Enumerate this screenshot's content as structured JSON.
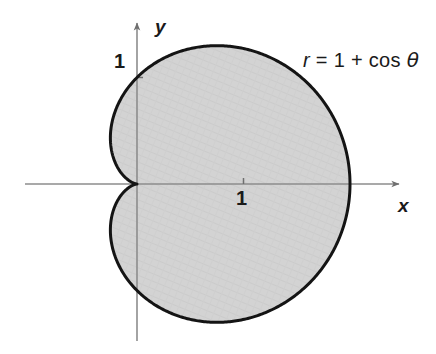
{
  "figure": {
    "kind": "polar-curve-plot",
    "background_color": "#ffffff",
    "curve_color": "#141414",
    "fill_color": "#d2d2d2",
    "axis_color": "#8d8d8d",
    "text_color": "#1a1a1a"
  },
  "axes": {
    "x_label": "x",
    "y_label": "y",
    "x_ticks": [
      {
        "value": 1,
        "label": "1"
      }
    ],
    "y_ticks": [
      {
        "value": 1,
        "label": "1"
      }
    ],
    "origin_px": {
      "x": 137,
      "y": 184
    },
    "unit_px": 106.5,
    "x_axis_span_px": {
      "from": 25,
      "to": 404
    },
    "y_axis_span_px": {
      "from": 18,
      "to": 341
    },
    "grid": false
  },
  "annotation": {
    "equation_r": "r",
    "equation_eq": "=",
    "equation_rhs_one": "1",
    "equation_plus": "+",
    "equation_cos": "cos",
    "equation_theta": "θ",
    "equation_full": "r = 1 + cos θ"
  },
  "chart_data": {
    "type": "line",
    "title": "",
    "subtitle": "",
    "xlabel": "x",
    "ylabel": "y",
    "curve_name": "cardioid",
    "polar_equation": "r = 1 + cos(theta)",
    "coordinate_system": "polar",
    "shaded_region": "interior of cardioid",
    "theta_range_deg": [
      0,
      360
    ],
    "xlim": [
      -1.29,
      3.55
    ],
    "ylim": [
      -1.55,
      1.55
    ],
    "xticks": [
      1
    ],
    "xticklabels": [
      "1"
    ],
    "yticks": [
      1
    ],
    "yticklabels": [
      "1"
    ],
    "grid": false,
    "legend": null,
    "annotations": [
      {
        "text": "r = 1 + cos θ",
        "x": 1.65,
        "y": 1.18
      }
    ],
    "key_points": [
      {
        "label": "cusp (theta=180deg)",
        "r": 0,
        "theta_deg": 180,
        "x": 0,
        "y": 0
      },
      {
        "label": "right vertex (theta=0deg)",
        "r": 2,
        "theta_deg": 0,
        "x": 2,
        "y": 0
      },
      {
        "label": "top (theta=90deg)",
        "r": 1,
        "theta_deg": 90,
        "x": 0,
        "y": 1
      },
      {
        "label": "bottom (theta=270deg)",
        "r": 1,
        "theta_deg": 270,
        "x": 0,
        "y": -1
      },
      {
        "label": "max y (theta=60deg)",
        "r": 1.5,
        "theta_deg": 60,
        "x": 0.75,
        "y": 1.299
      },
      {
        "label": "min y (theta=300deg)",
        "r": 1.5,
        "theta_deg": 300,
        "x": 0.75,
        "y": -1.299
      },
      {
        "label": "leftmost (theta=120deg)",
        "r": 0.5,
        "theta_deg": 120,
        "x": -0.25,
        "y": 0.433
      }
    ],
    "series": [
      {
        "name": "r = 1 + cos(theta)",
        "theta_deg": [
          0,
          15,
          30,
          45,
          60,
          75,
          90,
          105,
          120,
          135,
          150,
          165,
          180,
          195,
          210,
          225,
          240,
          255,
          270,
          285,
          300,
          315,
          330,
          345,
          360
        ],
        "r": [
          2.0,
          1.966,
          1.866,
          1.707,
          1.5,
          1.259,
          1.0,
          0.741,
          0.5,
          0.293,
          0.134,
          0.034,
          0.0,
          0.034,
          0.134,
          0.293,
          0.5,
          0.741,
          1.0,
          1.259,
          1.5,
          1.707,
          1.866,
          1.966,
          2.0
        ],
        "x": [
          2.0,
          1.899,
          1.616,
          1.207,
          0.75,
          0.326,
          0.0,
          -0.192,
          -0.25,
          -0.207,
          -0.116,
          -0.033,
          0.0,
          -0.033,
          -0.116,
          -0.207,
          -0.25,
          -0.192,
          0.0,
          0.326,
          0.75,
          1.207,
          1.616,
          1.899,
          2.0
        ],
        "y": [
          0.0,
          0.509,
          0.933,
          1.207,
          1.299,
          1.216,
          1.0,
          0.716,
          0.433,
          0.207,
          0.067,
          0.009,
          0.0,
          -0.009,
          -0.067,
          -0.207,
          -0.433,
          -0.716,
          -1.0,
          -1.216,
          -1.299,
          -1.207,
          -0.933,
          -0.509,
          0.0
        ]
      }
    ]
  }
}
